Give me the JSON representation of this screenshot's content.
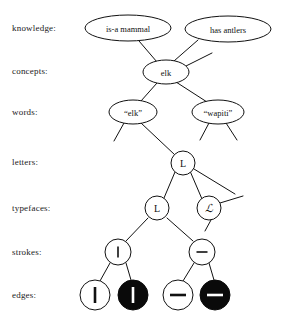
{
  "diagram": {
    "rows": [
      {
        "key": "knowledge",
        "label": "knowledge:",
        "label_x": 12,
        "label_y": 31
      },
      {
        "key": "concepts",
        "label": "concepts:",
        "label_x": 12,
        "label_y": 74
      },
      {
        "key": "words",
        "label": "words:",
        "label_x": 12,
        "label_y": 115
      },
      {
        "key": "letters",
        "label": "letters:",
        "label_x": 12,
        "label_y": 165
      },
      {
        "key": "typefaces",
        "label": "typefaces:",
        "label_x": 12,
        "label_y": 211
      },
      {
        "key": "strokes",
        "label": "strokes:",
        "label_x": 12,
        "label_y": 255
      },
      {
        "key": "edges",
        "label": "edges:",
        "label_x": 12,
        "label_y": 298
      }
    ],
    "nodes": [
      {
        "id": "is-a-mammal",
        "row": "knowledge",
        "text": "is-a mammal",
        "shape": "ellipse",
        "cx": 128,
        "cy": 28,
        "rx": 43,
        "ry": 13
      },
      {
        "id": "has-antlers",
        "row": "knowledge",
        "text": "has antlers",
        "shape": "ellipse",
        "cx": 228,
        "cy": 29,
        "rx": 43,
        "ry": 13
      },
      {
        "id": "elk-concept",
        "row": "concepts",
        "text": "elk",
        "shape": "ellipse",
        "cx": 166,
        "cy": 72,
        "rx": 23,
        "ry": 12
      },
      {
        "id": "elk-word",
        "row": "words",
        "text": "“elk”",
        "shape": "ellipse",
        "cx": 133,
        "cy": 112,
        "rx": 24,
        "ry": 12
      },
      {
        "id": "wapiti-word",
        "row": "words",
        "text": "“wapiti”",
        "shape": "ellipse",
        "cx": 218,
        "cy": 112,
        "rx": 26,
        "ry": 12
      },
      {
        "id": "letter-L",
        "row": "letters",
        "text": "L",
        "shape": "circle",
        "cx": 183,
        "cy": 163,
        "r": 12
      },
      {
        "id": "typeface-L-roman",
        "row": "typefaces",
        "text": "L",
        "shape": "circle",
        "cx": 157,
        "cy": 208,
        "r": 12
      },
      {
        "id": "typeface-L-script",
        "row": "typefaces",
        "text": "ℒ",
        "shape": "circle",
        "cx": 209,
        "cy": 208,
        "r": 12
      },
      {
        "id": "stroke-vertical",
        "row": "strokes",
        "text": "|",
        "shape": "circle",
        "cx": 118,
        "cy": 252,
        "r": 13,
        "glyph": "vertical-stroke"
      },
      {
        "id": "stroke-horizontal",
        "row": "strokes",
        "text": "–",
        "shape": "circle",
        "cx": 202,
        "cy": 252,
        "r": 13,
        "glyph": "horizontal-stroke"
      },
      {
        "id": "edge-vertical-light",
        "row": "edges",
        "text": "|",
        "shape": "circle",
        "cx": 95,
        "cy": 295,
        "r": 15,
        "glyph": "vertical-stroke",
        "fill": "white"
      },
      {
        "id": "edge-vertical-dark",
        "row": "edges",
        "text": "|",
        "shape": "circle",
        "cx": 133,
        "cy": 295,
        "r": 15,
        "glyph": "vertical-stroke",
        "fill": "black"
      },
      {
        "id": "edge-horizontal-light",
        "row": "edges",
        "text": "–",
        "shape": "circle",
        "cx": 178,
        "cy": 295,
        "r": 15,
        "glyph": "horizontal-stroke",
        "fill": "white"
      },
      {
        "id": "edge-horizontal-dark",
        "row": "edges",
        "text": "–",
        "shape": "circle",
        "cx": 215,
        "cy": 295,
        "r": 15,
        "glyph": "horizontal-stroke",
        "fill": "black"
      }
    ],
    "links": [
      {
        "from": "elk-concept",
        "to": "is-a-mammal",
        "x1": 157,
        "y1": 62,
        "x2": 139,
        "y2": 41
      },
      {
        "from": "elk-concept",
        "to": "has-antlers",
        "x1": 174,
        "y1": 61,
        "x2": 198,
        "y2": 40
      },
      {
        "from": "elk-concept",
        "to": "dangling-upper-right",
        "x1": 186,
        "y1": 66,
        "x2": 212,
        "y2": 53
      },
      {
        "from": "elk-concept",
        "to": "elk-word",
        "x1": 157,
        "y1": 83,
        "x2": 141,
        "y2": 101
      },
      {
        "from": "elk-concept",
        "to": "wapiti-word",
        "x1": 176,
        "y1": 82,
        "x2": 207,
        "y2": 102
      },
      {
        "from": "elk-word",
        "to": "dangling-lower-left",
        "x1": 124,
        "y1": 123,
        "x2": 114,
        "y2": 141
      },
      {
        "from": "elk-word",
        "to": "letter-L",
        "x1": 141,
        "y1": 123,
        "x2": 175,
        "y2": 155
      },
      {
        "from": "wapiti-word",
        "to": "dangling-lower-left-2",
        "x1": 209,
        "y1": 123,
        "x2": 200,
        "y2": 140
      },
      {
        "from": "wapiti-word",
        "to": "dangling-lower-right",
        "x1": 226,
        "y1": 123,
        "x2": 237,
        "y2": 140
      },
      {
        "from": "letter-L",
        "to": "typeface-L-roman",
        "x1": 175,
        "y1": 172,
        "x2": 164,
        "y2": 198
      },
      {
        "from": "letter-L",
        "to": "typeface-L-script",
        "x1": 190,
        "y1": 171,
        "x2": 202,
        "y2": 199
      },
      {
        "from": "letter-L",
        "to": "dangling-right",
        "x1": 194,
        "y1": 169,
        "x2": 235,
        "y2": 194
      },
      {
        "from": "typeface-L-script",
        "to": "dangling-right-2",
        "x1": 220,
        "y1": 203,
        "x2": 243,
        "y2": 196
      },
      {
        "from": "typeface-L-script",
        "to": "dangling-down",
        "x1": 211,
        "y1": 220,
        "x2": 205,
        "y2": 231
      },
      {
        "from": "typeface-L-roman",
        "to": "stroke-vertical",
        "x1": 148,
        "y1": 218,
        "x2": 126,
        "y2": 241
      },
      {
        "from": "typeface-L-roman",
        "to": "stroke-horizontal",
        "x1": 167,
        "y1": 218,
        "x2": 193,
        "y2": 241
      },
      {
        "from": "stroke-vertical",
        "to": "edge-vertical-light",
        "x1": 110,
        "y1": 263,
        "x2": 100,
        "y2": 281
      },
      {
        "from": "stroke-vertical",
        "to": "edge-vertical-dark",
        "x1": 126,
        "y1": 263,
        "x2": 131,
        "y2": 280
      },
      {
        "from": "stroke-horizontal",
        "to": "edge-horizontal-light",
        "x1": 194,
        "y1": 263,
        "x2": 183,
        "y2": 281
      },
      {
        "from": "stroke-horizontal",
        "to": "edge-horizontal-dark",
        "x1": 209,
        "y1": 263,
        "x2": 214,
        "y2": 280
      }
    ],
    "colors": {
      "stroke": "#111111",
      "node_fill_light": "#ffffff",
      "node_fill_dark": "#0a0a0a",
      "background": "#ffffff",
      "text": "#1a1a1a"
    }
  }
}
